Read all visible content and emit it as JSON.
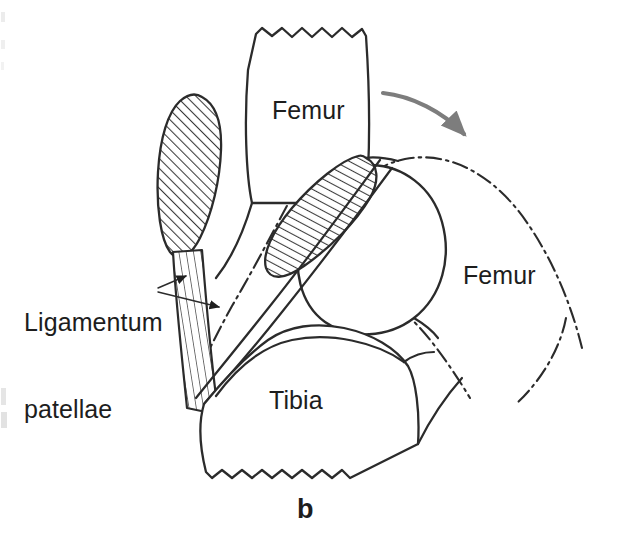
{
  "figure": {
    "caption": "b",
    "type": "anatomical line drawing"
  },
  "labels": {
    "femur_proximal": "Femur",
    "femur_rotated": "Femur",
    "tibia": "Tibia",
    "ligamentum_patellae_line1": "Ligamentum",
    "ligamentum_patellae_line2": "patellae"
  },
  "icons": {
    "rotation_arrow": "curved-rotation-arrow",
    "leader_arrow_upper": "leader-arrow-icon",
    "leader_arrow_lower": "leader-arrow-icon"
  },
  "colors": {
    "outline": "#2b2b2b",
    "hatch": "#3a3a3a",
    "stripe": "#4a4a4a",
    "rotation_arrow": "#7d7d7d",
    "background": "#ffffff",
    "text": "#1d1d1d"
  },
  "structures": {
    "patella_extended": "patella in extension (cross-hatched)",
    "patella_flexed": "patella in flexion (cross-hatched)",
    "ligamentum_patellae": "patellar ligament (vertically striped band)",
    "femoral_condyle": "femoral condyle outline",
    "rotated_outline": "dash-dot outline of rotated femur position",
    "femur_fracture_edge": "zigzag cut edge of femoral shaft",
    "tibia_fracture_edge": "zigzag cut edge of tibial shaft"
  }
}
